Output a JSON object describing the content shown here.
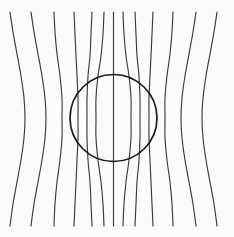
{
  "figure": {
    "type": "field-line-diagram",
    "width": 234,
    "height": 237,
    "background_color": "#fbfbfb",
    "line_color": "#3a3a3a",
    "circle_color": "#1a1a1a",
    "line_width": 1.15,
    "circle_width": 1.7
  },
  "chart_data": {
    "type": "line",
    "subtitle": "",
    "xlabel": "",
    "ylabel": "",
    "xlim": [
      0,
      234
    ],
    "ylim": [
      0,
      237
    ],
    "grid": false,
    "legend": "none",
    "annotations": [],
    "circle": {
      "name": "obstacle-circle",
      "cx": 113.5,
      "cy": 118,
      "r": 43.5
    },
    "series": [
      {
        "name": "flux-line-1",
        "x_top": 10,
        "x_mid": 25,
        "x_bottom": 10,
        "points": [
          [
            10,
            12
          ],
          [
            13,
            32
          ],
          [
            17,
            54
          ],
          [
            21,
            76
          ],
          [
            24,
            98
          ],
          [
            25,
            118
          ],
          [
            24,
            138
          ],
          [
            21,
            160
          ],
          [
            17,
            182
          ],
          [
            13,
            204
          ],
          [
            10,
            226
          ]
        ]
      },
      {
        "name": "flux-line-2",
        "x_top": 31,
        "x_mid": 46,
        "x_bottom": 31,
        "points": [
          [
            31,
            12
          ],
          [
            34,
            32
          ],
          [
            38,
            54
          ],
          [
            42,
            76
          ],
          [
            45,
            98
          ],
          [
            46,
            118
          ],
          [
            45,
            138
          ],
          [
            42,
            160
          ],
          [
            38,
            182
          ],
          [
            34,
            204
          ],
          [
            31,
            226
          ]
        ]
      },
      {
        "name": "flux-line-3",
        "x_top": 54,
        "x_mid": 62,
        "x_bottom": 54,
        "points": [
          [
            54,
            12
          ],
          [
            55,
            32
          ],
          [
            57,
            54
          ],
          [
            60,
            76
          ],
          [
            62,
            98
          ],
          [
            62,
            118
          ],
          [
            62,
            138
          ],
          [
            60,
            160
          ],
          [
            57,
            182
          ],
          [
            55,
            204
          ],
          [
            54,
            226
          ]
        ]
      },
      {
        "name": "flux-line-4",
        "x_top": 74,
        "x_mid": 78,
        "x_bottom": 74,
        "points": [
          [
            74,
            12
          ],
          [
            75,
            34
          ],
          [
            76,
            56
          ],
          [
            77,
            76
          ],
          [
            78,
            98
          ],
          [
            78,
            118
          ],
          [
            78,
            138
          ],
          [
            77,
            160
          ],
          [
            76,
            182
          ],
          [
            75,
            204
          ],
          [
            74,
            226
          ]
        ]
      },
      {
        "name": "flux-line-5",
        "x_top": 92,
        "x_mid": 87,
        "x_bottom": 92,
        "points": [
          [
            92,
            12
          ],
          [
            91,
            34
          ],
          [
            90,
            56
          ],
          [
            88,
            76
          ],
          [
            87,
            98
          ],
          [
            87,
            118
          ],
          [
            87,
            138
          ],
          [
            88,
            160
          ],
          [
            90,
            182
          ],
          [
            91,
            204
          ],
          [
            92,
            226
          ]
        ]
      },
      {
        "name": "flux-line-6",
        "x_top": 104,
        "x_mid": 96,
        "x_bottom": 104,
        "points": [
          [
            104,
            12
          ],
          [
            103,
            34
          ],
          [
            101,
            56
          ],
          [
            98,
            76
          ],
          [
            96,
            98
          ],
          [
            96,
            118
          ],
          [
            96,
            138
          ],
          [
            98,
            160
          ],
          [
            101,
            182
          ],
          [
            103,
            204
          ],
          [
            104,
            226
          ]
        ]
      },
      {
        "name": "flux-line-7",
        "x_top": 113.5,
        "x_mid": 113.5,
        "x_bottom": 113.5,
        "points": [
          [
            113.5,
            12
          ],
          [
            113.5,
            34
          ],
          [
            113.5,
            56
          ],
          [
            113.5,
            76
          ],
          [
            113.5,
            98
          ],
          [
            113.5,
            118
          ],
          [
            113.5,
            138
          ],
          [
            113.5,
            160
          ],
          [
            113.5,
            182
          ],
          [
            113.5,
            204
          ],
          [
            113.5,
            226
          ]
        ]
      },
      {
        "name": "flux-line-8",
        "x_top": 123,
        "x_mid": 131,
        "x_bottom": 123,
        "points": [
          [
            123,
            12
          ],
          [
            124,
            34
          ],
          [
            126,
            56
          ],
          [
            129,
            76
          ],
          [
            131,
            98
          ],
          [
            131,
            118
          ],
          [
            131,
            138
          ],
          [
            129,
            160
          ],
          [
            126,
            182
          ],
          [
            124,
            204
          ],
          [
            123,
            226
          ]
        ]
      },
      {
        "name": "flux-line-9",
        "x_top": 135,
        "x_mid": 140,
        "x_bottom": 135,
        "points": [
          [
            135,
            12
          ],
          [
            136,
            34
          ],
          [
            137,
            56
          ],
          [
            139,
            76
          ],
          [
            140,
            98
          ],
          [
            140,
            118
          ],
          [
            140,
            138
          ],
          [
            139,
            160
          ],
          [
            137,
            182
          ],
          [
            136,
            204
          ],
          [
            135,
            226
          ]
        ]
      },
      {
        "name": "flux-line-10",
        "x_top": 153,
        "x_mid": 149,
        "x_bottom": 153,
        "points": [
          [
            153,
            12
          ],
          [
            152,
            34
          ],
          [
            151,
            56
          ],
          [
            150,
            76
          ],
          [
            149,
            98
          ],
          [
            149,
            118
          ],
          [
            149,
            138
          ],
          [
            150,
            160
          ],
          [
            151,
            182
          ],
          [
            152,
            204
          ],
          [
            153,
            226
          ]
        ]
      },
      {
        "name": "flux-line-11",
        "x_top": 173,
        "x_mid": 165,
        "x_bottom": 173,
        "points": [
          [
            173,
            12
          ],
          [
            172,
            32
          ],
          [
            170,
            54
          ],
          [
            167,
            76
          ],
          [
            165,
            98
          ],
          [
            165,
            118
          ],
          [
            165,
            138
          ],
          [
            167,
            160
          ],
          [
            170,
            182
          ],
          [
            172,
            204
          ],
          [
            173,
            226
          ]
        ]
      },
      {
        "name": "flux-line-12",
        "x_top": 196,
        "x_mid": 181,
        "x_bottom": 196,
        "points": [
          [
            196,
            12
          ],
          [
            193,
            32
          ],
          [
            189,
            54
          ],
          [
            185,
            76
          ],
          [
            182,
            98
          ],
          [
            181,
            118
          ],
          [
            182,
            138
          ],
          [
            185,
            160
          ],
          [
            189,
            182
          ],
          [
            193,
            204
          ],
          [
            196,
            226
          ]
        ]
      },
      {
        "name": "flux-line-13",
        "x_top": 217,
        "x_mid": 202,
        "x_bottom": 217,
        "points": [
          [
            217,
            12
          ],
          [
            214,
            32
          ],
          [
            210,
            54
          ],
          [
            206,
            76
          ],
          [
            203,
            98
          ],
          [
            202,
            118
          ],
          [
            203,
            138
          ],
          [
            206,
            160
          ],
          [
            210,
            182
          ],
          [
            214,
            204
          ],
          [
            217,
            226
          ]
        ]
      }
    ]
  }
}
